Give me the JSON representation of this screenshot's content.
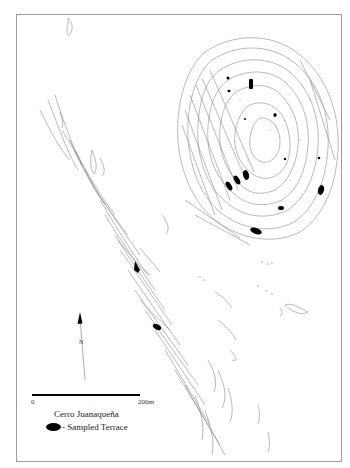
{
  "map": {
    "site_name": "Cerro Juanaquena",
    "site_name_display": "Cerro Juanaqueña",
    "north_label": "N",
    "scale": {
      "start_label": "0",
      "end_label": "200m"
    },
    "legend": {
      "symbol": "black filled terrace",
      "label": "- Sampled Terrace"
    },
    "colors": {
      "contour": "#8a8a8a",
      "terrace_fill": "#000000",
      "frame": "#9a9a9a",
      "background": "#ffffff"
    },
    "features": {
      "hill_outline": "large oval hill with concentric terrace contours (upper right)",
      "ridge": "long diagonal ridge of terraces running NW to SE (left/center)",
      "sampled_terraces_count": 17
    }
  }
}
